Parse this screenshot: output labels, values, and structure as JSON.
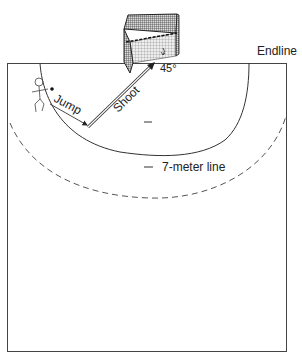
{
  "diagram": {
    "labels": {
      "endline": "Endline",
      "jump": "Jump",
      "shoot": "Shoot",
      "angle": "45°",
      "seven_meter": "7-meter line"
    },
    "colors": {
      "line": "#333333",
      "dashed": "#555555",
      "background": "#ffffff"
    }
  }
}
